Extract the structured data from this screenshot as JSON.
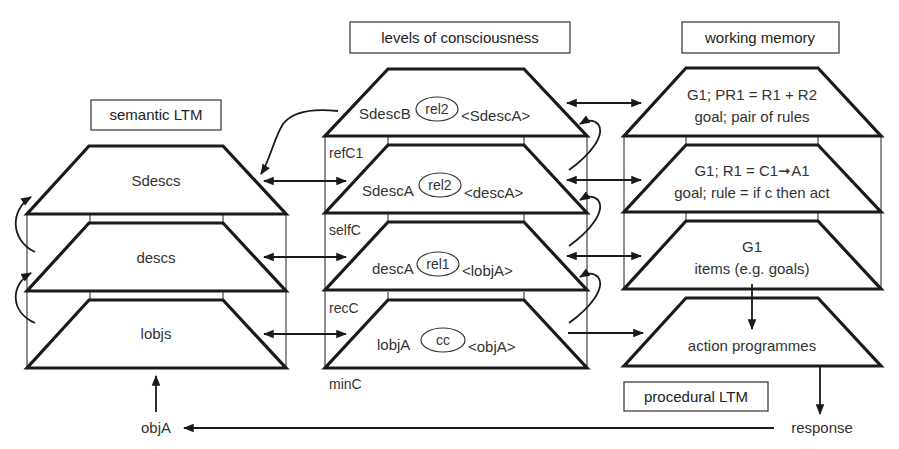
{
  "headers": {
    "semantic_ltm": "semantic LTM",
    "levels": "levels of consciousness",
    "working_memory": "working memory",
    "procedural_ltm": "procedural LTM"
  },
  "semantic_ltm": {
    "layers": [
      {
        "label": "Sdescs"
      },
      {
        "label": "descs"
      },
      {
        "label": "lobjs"
      }
    ]
  },
  "consciousness": {
    "layers": [
      {
        "left": "SdescB",
        "relation": "rel2",
        "right": "<SdescA>"
      },
      {
        "left": "SdescA",
        "relation": "rel2",
        "right": "<descA>"
      },
      {
        "left": "descA",
        "relation": "rel1",
        "right": "<lobjA>"
      },
      {
        "left": "lobjA",
        "relation": "cc",
        "right": "<objA>"
      }
    ],
    "level_labels": [
      "refC1",
      "selfC",
      "recC",
      "minC"
    ]
  },
  "working_memory": {
    "layers": [
      {
        "line1": "G1; PR1 = R1 + R2",
        "line2": "goal; pair of rules"
      },
      {
        "line1": "G1; R1 = C1➞A1",
        "line2": "goal; rule = if c then act"
      },
      {
        "line1": "G1",
        "line2": "items (e.g. goals)"
      }
    ]
  },
  "procedural_ltm": {
    "layers": [
      {
        "label": "action programmes"
      }
    ]
  },
  "io": {
    "input": "objA",
    "output": "response"
  },
  "colors": {
    "stroke": "#1a1a1a",
    "text": "#333333",
    "background": "#ffffff"
  }
}
